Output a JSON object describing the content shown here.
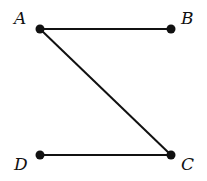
{
  "diagram": {
    "type": "line-segments",
    "colors": {
      "stroke": "#111111",
      "background": "#ffffff"
    },
    "points": [
      {
        "id": "A",
        "label": "A",
        "x": 40,
        "y": 29,
        "label_x": 14,
        "label_y": 24
      },
      {
        "id": "B",
        "label": "B",
        "x": 171,
        "y": 29,
        "label_x": 181,
        "label_y": 24
      },
      {
        "id": "C",
        "label": "C",
        "x": 171,
        "y": 155,
        "label_x": 181,
        "label_y": 170
      },
      {
        "id": "D",
        "label": "D",
        "x": 40,
        "y": 155,
        "label_x": 14,
        "label_y": 170
      }
    ],
    "segments": [
      {
        "from": "A",
        "to": "B"
      },
      {
        "from": "A",
        "to": "C"
      },
      {
        "from": "D",
        "to": "C"
      }
    ]
  }
}
